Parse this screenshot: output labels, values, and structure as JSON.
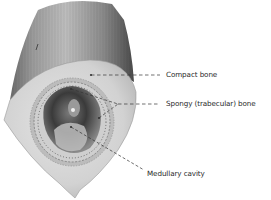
{
  "diagram": {
    "labels": {
      "compact_bone": "Compact bone",
      "spongy_bone": "Spongy (trabecular) bone",
      "medullary_cavity": "Medullary cavity"
    },
    "colors": {
      "background": "#ffffff",
      "bone_surface_light": "#d9d9d9",
      "bone_surface_dark": "#555555",
      "cross_section": "#d4d4d4",
      "cavity_dark": "#3a3a3a",
      "leader_line": "#333333",
      "text": "#2a2a2a"
    }
  }
}
